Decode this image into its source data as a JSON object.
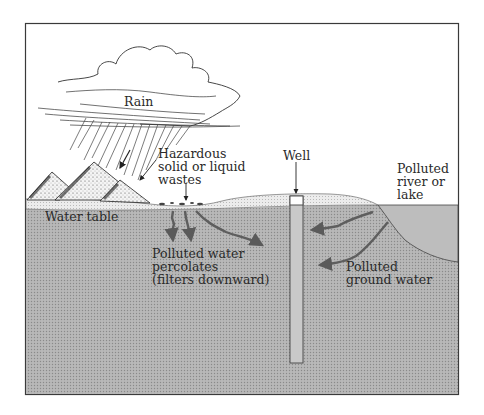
{
  "diagram": {
    "type": "cross-section illustration",
    "labels": {
      "rain": "Rain",
      "hazardous_wastes": "Hazardous\nsolid or liquid\nwastes",
      "well": "Well",
      "polluted_river": "Polluted\nriver or\nlake",
      "water_table": "Water table",
      "polluted_water_percolates": "Polluted water\npercolates\n(filters downward)",
      "polluted_ground_water": "Polluted\nground water"
    },
    "colors": {
      "ground_fill": "#b4b4b4",
      "ground_dot": "#8e8e8e",
      "lake_fill": "#bcbcbc",
      "topsoil": "#e6e6e6",
      "outline": "#3a3a3a",
      "arrow": "#606060",
      "well_fill": "#c8c8c8",
      "background": "#ffffff"
    }
  }
}
